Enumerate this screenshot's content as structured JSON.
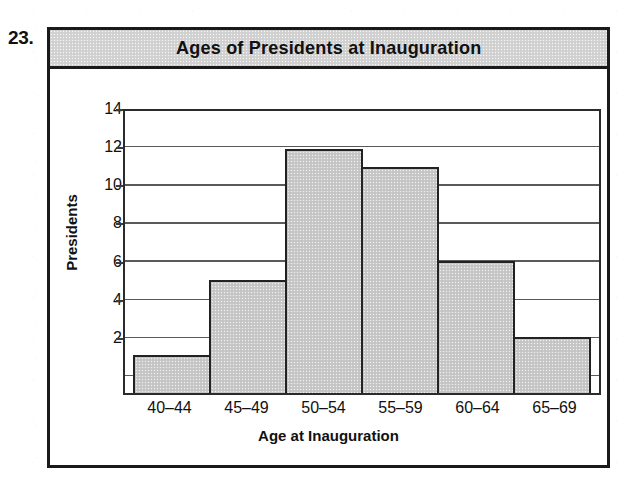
{
  "question_number": "23.",
  "chart_data": {
    "type": "bar",
    "title": "Ages of Presidents at Inauguration",
    "xlabel": "Age at Inauguration",
    "ylabel": "Presidents",
    "categories": [
      "40–44",
      "45–49",
      "50–54",
      "55–59",
      "60–64",
      "65–69"
    ],
    "values": [
      2,
      6,
      13,
      12,
      7,
      3
    ],
    "ytick_labels": [
      "2",
      "4",
      "6",
      "8",
      "10",
      "12",
      "14"
    ],
    "ytick_values": [
      2,
      4,
      6,
      8,
      10,
      12,
      14
    ],
    "ylim": [
      0,
      15
    ],
    "grid": true,
    "legend": "none",
    "bar_fill_color": "#c9c9c9",
    "bar_edge_color": "#222222",
    "title_band_color": "#d3d3d3",
    "frame_color": "#1a1a1a"
  }
}
